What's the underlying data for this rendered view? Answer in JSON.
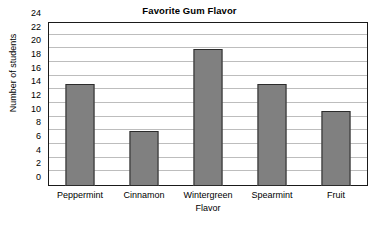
{
  "chart_data": {
    "type": "bar",
    "title": "Favorite Gum Flavor",
    "xlabel": "Flavor",
    "ylabel": "Number of students",
    "categories": [
      "Peppermint",
      "Cinnamon",
      "Wintergreen",
      "Spearmint",
      "Fruit"
    ],
    "values": [
      15,
      8,
      20,
      15,
      11
    ],
    "ylim": [
      0,
      24
    ],
    "ytick_labels": [
      "0",
      "2",
      "4",
      "6",
      "8",
      "10",
      "12",
      "14",
      "16",
      "18",
      "20",
      "22",
      "24"
    ],
    "ytick_values": [
      0,
      2,
      4,
      6,
      8,
      10,
      12,
      14,
      16,
      18,
      20,
      22,
      24
    ],
    "grid": "horizontal",
    "legend": "none",
    "bar_color": "#808080",
    "bar_edge_color": "#2b2b2b",
    "grid_color": "#bdbdbd",
    "frame_color": "#1a1a1a",
    "background": "#ffffff"
  }
}
